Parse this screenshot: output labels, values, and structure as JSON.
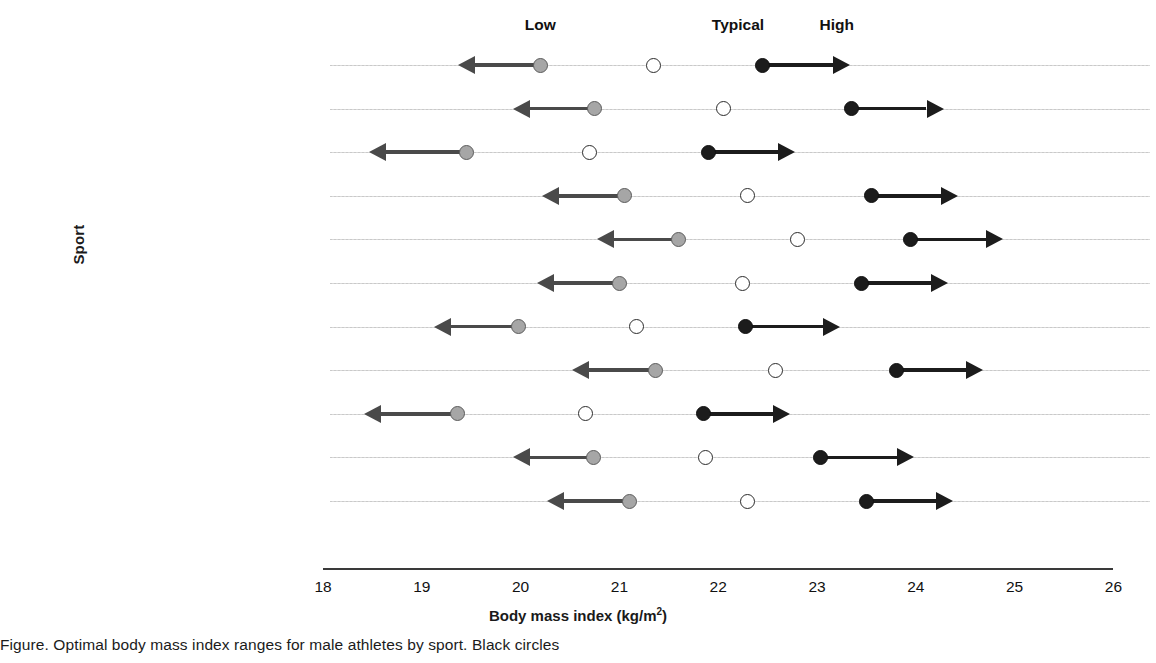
{
  "chart_data": {
    "type": "scatter",
    "title": "",
    "xlabel": "Body mass index (kg/m2)",
    "xlabel_base": "Body mass index (kg/m",
    "xlabel_sup": "2",
    "xlabel_tail": ")",
    "ylabel": "Sport",
    "xlim": [
      18,
      26
    ],
    "xticks": [
      18,
      19,
      20,
      21,
      22,
      23,
      24,
      25,
      26
    ],
    "grid": true,
    "legend_position": "top",
    "column_headers": [
      {
        "label": "Low",
        "value": 20.2
      },
      {
        "label": "Typical",
        "value": 22.2
      },
      {
        "label": "High",
        "value": 23.2
      }
    ],
    "series": [
      {
        "name": "Low",
        "marker": "filled-gray-circle-with-left-arrow",
        "color": "#a6a6a6"
      },
      {
        "name": "Typical",
        "marker": "open-circle",
        "color": "#ffffff"
      },
      {
        "name": "High",
        "marker": "filled-black-circle-with-right-arrow",
        "color": "#1c1c1c"
      }
    ],
    "categories": [
      "Track and field",
      "Basketball",
      "Gymnastics",
      "Striking, combat sports",
      "Rowing",
      "Soccer",
      "Swimming",
      "Tennis",
      "Triathlon",
      "Volleyball",
      "Grappling, combat sports"
    ],
    "rows": [
      {
        "sport": "Track and field",
        "low": 20.2,
        "typical": 21.35,
        "high": 22.45,
        "low_arrow_end": 19.4,
        "high_arrow_end": 23.3
      },
      {
        "sport": "Basketball",
        "low": 20.75,
        "typical": 22.05,
        "high": 23.35,
        "low_arrow_end": 19.95,
        "high_arrow_end": 24.25
      },
      {
        "sport": "Gymnastics",
        "low": 19.45,
        "typical": 20.7,
        "high": 21.9,
        "low_arrow_end": 18.5,
        "high_arrow_end": 22.75
      },
      {
        "sport": "Striking, combat sports",
        "low": 21.05,
        "typical": 22.3,
        "high": 23.55,
        "low_arrow_end": 20.25,
        "high_arrow_end": 24.4
      },
      {
        "sport": "Rowing",
        "low": 21.6,
        "typical": 22.8,
        "high": 23.95,
        "low_arrow_end": 20.8,
        "high_arrow_end": 24.85
      },
      {
        "sport": "Soccer",
        "low": 21.0,
        "typical": 22.25,
        "high": 23.45,
        "low_arrow_end": 20.2,
        "high_arrow_end": 24.3
      },
      {
        "sport": "Swimming",
        "low": 19.98,
        "typical": 21.17,
        "high": 22.28,
        "low_arrow_end": 19.15,
        "high_arrow_end": 23.2
      },
      {
        "sport": "Tennis",
        "low": 21.37,
        "typical": 22.58,
        "high": 23.8,
        "low_arrow_end": 20.55,
        "high_arrow_end": 24.65
      },
      {
        "sport": "Triathlon",
        "low": 19.36,
        "typical": 20.66,
        "high": 21.85,
        "low_arrow_end": 18.45,
        "high_arrow_end": 22.7
      },
      {
        "sport": "Volleyball",
        "low": 20.74,
        "typical": 21.87,
        "high": 23.04,
        "low_arrow_end": 19.95,
        "high_arrow_end": 23.95
      },
      {
        "sport": "Grappling, combat sports",
        "low": 21.1,
        "typical": 22.3,
        "high": 23.5,
        "low_arrow_end": 20.3,
        "high_arrow_end": 24.35
      }
    ]
  },
  "caption": "Figure. Optimal body mass index ranges for male athletes by sport. Black circles"
}
